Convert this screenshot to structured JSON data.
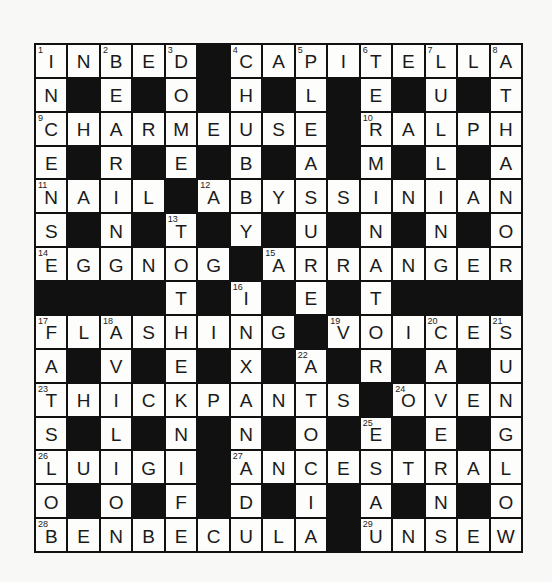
{
  "puzzle": {
    "size": 15,
    "rows": [
      "INBED#CAPITELLA",
      "N#E#O#H#L#E#U#T",
      "CHARMEUSE#RALPH",
      "E#R#E#B#A#M#L#A",
      "NAIL#ABYSSINIAN",
      "S#N#T#Y#U#N#N#O",
      "EGGNOG#ARRANGER",
      "####T#I#E#T####",
      "FLASHING#VOICES",
      "A#V#E#X#A#R#A#U",
      "THICKPANTS#OVEN",
      "S#L#N#N#O#E#E#G",
      "LUIGI#ANCESTRAL",
      "O#O#F#D#I#A#N#O",
      "BENBECULA#UNSEW"
    ],
    "numbers": [
      {
        "r": 0,
        "c": 0,
        "n": "1"
      },
      {
        "r": 0,
        "c": 2,
        "n": "2"
      },
      {
        "r": 0,
        "c": 4,
        "n": "3"
      },
      {
        "r": 0,
        "c": 6,
        "n": "4"
      },
      {
        "r": 0,
        "c": 8,
        "n": "5"
      },
      {
        "r": 0,
        "c": 10,
        "n": "6"
      },
      {
        "r": 0,
        "c": 12,
        "n": "7"
      },
      {
        "r": 0,
        "c": 14,
        "n": "8"
      },
      {
        "r": 2,
        "c": 0,
        "n": "9"
      },
      {
        "r": 2,
        "c": 10,
        "n": "10"
      },
      {
        "r": 4,
        "c": 0,
        "n": "11"
      },
      {
        "r": 4,
        "c": 5,
        "n": "12"
      },
      {
        "r": 5,
        "c": 4,
        "n": "13"
      },
      {
        "r": 6,
        "c": 0,
        "n": "14"
      },
      {
        "r": 6,
        "c": 7,
        "n": "15"
      },
      {
        "r": 7,
        "c": 6,
        "n": "16"
      },
      {
        "r": 8,
        "c": 0,
        "n": "17"
      },
      {
        "r": 8,
        "c": 2,
        "n": "18"
      },
      {
        "r": 8,
        "c": 9,
        "n": "19"
      },
      {
        "r": 8,
        "c": 12,
        "n": "20"
      },
      {
        "r": 8,
        "c": 14,
        "n": "21"
      },
      {
        "r": 9,
        "c": 8,
        "n": "22"
      },
      {
        "r": 10,
        "c": 0,
        "n": "23"
      },
      {
        "r": 10,
        "c": 11,
        "n": "24"
      },
      {
        "r": 11,
        "c": 10,
        "n": "25"
      },
      {
        "r": 12,
        "c": 0,
        "n": "26"
      },
      {
        "r": 12,
        "c": 6,
        "n": "27"
      },
      {
        "r": 14,
        "c": 0,
        "n": "28"
      },
      {
        "r": 14,
        "c": 10,
        "n": "29"
      }
    ],
    "colors": {
      "block": "#111111",
      "cell": "#fdfdfc",
      "background": "#f8f8f6"
    }
  }
}
